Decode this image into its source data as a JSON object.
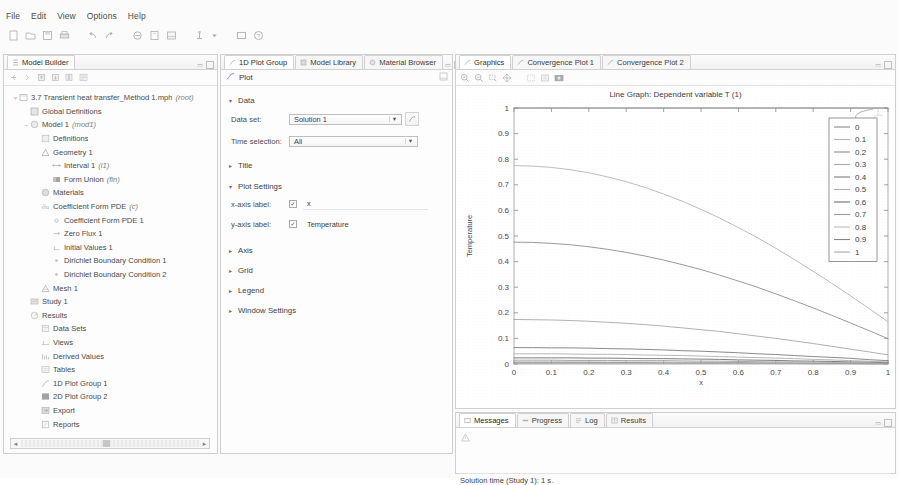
{
  "menubar": {
    "items": [
      "File",
      "Edit",
      "View",
      "Options",
      "Help"
    ]
  },
  "toolbar": {
    "icons": [
      "new-icon",
      "open-icon",
      "save-icon",
      "print-icon",
      "undo-icon",
      "redo-icon",
      "copy-icon",
      "paste-icon",
      "delete-icon",
      "build-icon",
      "dropdown-arrow-icon",
      "window-icon",
      "help-icon"
    ]
  },
  "model_builder": {
    "tab_label": "Model Builder",
    "toolbar_icons": [
      "collapse-icon",
      "expand-icon",
      "move-up-icon",
      "move-down-icon",
      "group-icon",
      "settings-icon"
    ],
    "tree": [
      {
        "depth": 0,
        "expander": "▿",
        "icon": "mph-file-icon",
        "label": "3.7 Transient heat transfer_Method 1.mph",
        "note": "(root)"
      },
      {
        "depth": 1,
        "expander": "",
        "icon": "global-definitions-icon",
        "label": "Global Definitions",
        "note": ""
      },
      {
        "depth": 1,
        "expander": "–",
        "icon": "model-icon",
        "label": "Model 1",
        "note": "(mod1)"
      },
      {
        "depth": 2,
        "expander": "",
        "icon": "definitions-icon",
        "label": "Definitions",
        "note": ""
      },
      {
        "depth": 2,
        "expander": "",
        "icon": "geometry-icon",
        "label": "Geometry 1",
        "note": ""
      },
      {
        "depth": 3,
        "expander": "",
        "icon": "interval-icon",
        "label": "Interval 1",
        "note": "(i1)"
      },
      {
        "depth": 3,
        "expander": "",
        "icon": "form-union-icon",
        "label": "Form Union",
        "note": "(fin)"
      },
      {
        "depth": 2,
        "expander": "",
        "icon": "materials-icon",
        "label": "Materials",
        "note": ""
      },
      {
        "depth": 2,
        "expander": "",
        "icon": "pde-icon",
        "label": "Coefficient Form PDE",
        "note": "(c)"
      },
      {
        "depth": 3,
        "expander": "",
        "icon": "node-icon",
        "label": "Coefficient Form PDE 1",
        "note": ""
      },
      {
        "depth": 3,
        "expander": "",
        "icon": "zero-flux-icon",
        "label": "Zero Flux 1",
        "note": ""
      },
      {
        "depth": 3,
        "expander": "",
        "icon": "initial-values-icon",
        "label": "Initial Values 1",
        "note": ""
      },
      {
        "depth": 3,
        "expander": "",
        "icon": "dirichlet-icon",
        "label": "Dirichlet Boundary Condition 1",
        "note": ""
      },
      {
        "depth": 3,
        "expander": "",
        "icon": "dirichlet-icon",
        "label": "Dirichlet Boundary Condition 2",
        "note": ""
      },
      {
        "depth": 2,
        "expander": "",
        "icon": "mesh-icon",
        "label": "Mesh 1",
        "note": ""
      },
      {
        "depth": 1,
        "expander": "",
        "icon": "study-icon",
        "label": "Study 1",
        "note": ""
      },
      {
        "depth": 1,
        "expander": "",
        "icon": "results-icon",
        "label": "Results",
        "note": ""
      },
      {
        "depth": 2,
        "expander": "",
        "icon": "data-sets-icon",
        "label": "Data Sets",
        "note": ""
      },
      {
        "depth": 2,
        "expander": "",
        "icon": "views-icon",
        "label": "Views",
        "note": ""
      },
      {
        "depth": 2,
        "expander": "",
        "icon": "derived-values-icon",
        "label": "Derived Values",
        "note": ""
      },
      {
        "depth": 2,
        "expander": "",
        "icon": "tables-icon",
        "label": "Tables",
        "note": ""
      },
      {
        "depth": 2,
        "expander": "",
        "icon": "plot-1d-icon",
        "label": "1D Plot Group 1",
        "note": ""
      },
      {
        "depth": 2,
        "expander": "",
        "icon": "plot-2d-icon",
        "label": "2D Plot Group 2",
        "note": ""
      },
      {
        "depth": 2,
        "expander": "",
        "icon": "export-icon",
        "label": "Export",
        "note": ""
      },
      {
        "depth": 2,
        "expander": "",
        "icon": "reports-icon",
        "label": "Reports",
        "note": ""
      }
    ]
  },
  "settings": {
    "tabs": [
      {
        "label": "1D Plot Group",
        "icon": "plot-1d-icon",
        "active": true
      },
      {
        "label": "Model Library",
        "icon": "library-icon",
        "active": false
      },
      {
        "label": "Material Browser",
        "icon": "material-icon",
        "active": false
      }
    ],
    "header_label": "Plot",
    "sections": {
      "data": {
        "title": "Data",
        "expanded": true,
        "arrow": "▾"
      },
      "title": {
        "title": "Title",
        "expanded": false,
        "arrow": "▸"
      },
      "plot_settings": {
        "title": "Plot Settings",
        "expanded": true,
        "arrow": "▾"
      },
      "axis": {
        "title": "Axis",
        "expanded": false,
        "arrow": "▸"
      },
      "grid": {
        "title": "Grid",
        "expanded": false,
        "arrow": "▸"
      },
      "legend": {
        "title": "Legend",
        "expanded": false,
        "arrow": "▸"
      },
      "window_settings": {
        "title": "Window Settings",
        "expanded": false,
        "arrow": "▸"
      }
    },
    "fields": {
      "data_set_label": "Data set:",
      "data_set_value": "Solution 1",
      "time_selection_label": "Time selection:",
      "time_selection_value": "All",
      "x_axis_label_label": "x-axis label:",
      "x_axis_label_value": "x",
      "x_axis_label_checked": true,
      "y_axis_label_label": "y-axis label:",
      "y_axis_label_value": "Temperature",
      "y_axis_label_checked": true,
      "checkmark": "✓"
    }
  },
  "graphics": {
    "tabs": [
      {
        "label": "Graphics",
        "icon": "graphics-icon",
        "active": true
      },
      {
        "label": "Convergence Plot 1",
        "icon": "graphics-icon",
        "active": false
      },
      {
        "label": "Convergence Plot 2",
        "icon": "graphics-icon",
        "active": false
      }
    ],
    "toolbar_icons": [
      "zoom-in-icon",
      "zoom-out-icon",
      "zoom-box-icon",
      "zoom-extents-icon",
      "select-icon",
      "transparency-icon",
      "image-snapshot-icon"
    ],
    "axis_orientation_icon": "axis-orientation-icon"
  },
  "messages": {
    "tabs": [
      {
        "label": "Messages",
        "icon": "messages-icon",
        "active": true
      },
      {
        "label": "Progress",
        "icon": "progress-icon",
        "active": false
      },
      {
        "label": "Log",
        "icon": "log-icon",
        "active": false
      },
      {
        "label": "Results",
        "icon": "results-table-icon",
        "active": false
      }
    ],
    "warning_icon": "warning-icon",
    "status_text": "Solution time (Study 1): 1 s."
  },
  "chart_data": {
    "type": "line",
    "title": "Line Graph: Dependent variable T (1)",
    "xlabel": "x",
    "ylabel": "Temperature",
    "xlim": [
      0,
      1
    ],
    "ylim": [
      0,
      1
    ],
    "xticks": [
      0,
      0.1,
      0.2,
      0.3,
      0.4,
      0.5,
      0.6,
      0.7,
      0.8,
      0.9,
      1
    ],
    "yticks": [
      0,
      0.1,
      0.2,
      0.3,
      0.4,
      0.5,
      0.6,
      0.7,
      0.8,
      0.9,
      1
    ],
    "grid": false,
    "legend_position": "upper right",
    "legend_title": "",
    "x": [
      0,
      0.05,
      0.1,
      0.15,
      0.2,
      0.25,
      0.3,
      0.35,
      0.4,
      0.45,
      0.5,
      0.55,
      0.6,
      0.65,
      0.7,
      0.75,
      0.8,
      0.85,
      0.9,
      0.95,
      1
    ],
    "series": [
      {
        "name": "0",
        "color": "#8a8a8a",
        "values": [
          1,
          1,
          1,
          1,
          1,
          1,
          1,
          1,
          1,
          1,
          1,
          1,
          1,
          1,
          1,
          1,
          1,
          1,
          1,
          1,
          1
        ]
      },
      {
        "name": "0.1",
        "color": "#b4b4b4",
        "values": [
          0.775,
          0.773,
          0.768,
          0.759,
          0.747,
          0.731,
          0.712,
          0.69,
          0.664,
          0.636,
          0.604,
          0.57,
          0.533,
          0.494,
          0.452,
          0.408,
          0.362,
          0.315,
          0.266,
          0.216,
          0.165
        ]
      },
      {
        "name": "0.2",
        "color": "#8f8f8f",
        "values": [
          0.476,
          0.475,
          0.471,
          0.466,
          0.458,
          0.448,
          0.436,
          0.422,
          0.406,
          0.388,
          0.369,
          0.347,
          0.324,
          0.3,
          0.274,
          0.247,
          0.219,
          0.19,
          0.16,
          0.13,
          0.099
        ]
      },
      {
        "name": "0.3",
        "color": "#a8a8a8",
        "values": [
          0.174,
          0.173,
          0.172,
          0.17,
          0.167,
          0.163,
          0.159,
          0.154,
          0.148,
          0.141,
          0.134,
          0.127,
          0.118,
          0.109,
          0.1,
          0.09,
          0.08,
          0.069,
          0.058,
          0.047,
          0.036
        ]
      },
      {
        "name": "0.4",
        "color": "#7e7e7e",
        "values": [
          0.064,
          0.064,
          0.063,
          0.063,
          0.062,
          0.06,
          0.059,
          0.057,
          0.055,
          0.052,
          0.05,
          0.047,
          0.044,
          0.04,
          0.037,
          0.033,
          0.029,
          0.026,
          0.022,
          0.017,
          0.013
        ]
      },
      {
        "name": "0.5",
        "color": "#b0b0b0",
        "values": [
          0.04,
          0.04,
          0.04,
          0.039,
          0.038,
          0.038,
          0.037,
          0.035,
          0.034,
          0.033,
          0.031,
          0.029,
          0.027,
          0.025,
          0.023,
          0.021,
          0.018,
          0.016,
          0.013,
          0.011,
          0.008
        ]
      },
      {
        "name": "0.6",
        "color": "#6f6f6f",
        "values": [
          0.024,
          0.024,
          0.024,
          0.024,
          0.023,
          0.023,
          0.022,
          0.021,
          0.021,
          0.02,
          0.019,
          0.018,
          0.016,
          0.015,
          0.014,
          0.012,
          0.011,
          0.01,
          0.008,
          0.007,
          0.005
        ]
      },
      {
        "name": "0.7",
        "color": "#9c9c9c",
        "values": [
          0.015,
          0.015,
          0.015,
          0.014,
          0.014,
          0.014,
          0.013,
          0.013,
          0.013,
          0.012,
          0.011,
          0.011,
          0.01,
          0.009,
          0.008,
          0.008,
          0.007,
          0.006,
          0.005,
          0.004,
          0.003
        ]
      },
      {
        "name": "0.8",
        "color": "#bdbdbd",
        "values": [
          0.009,
          0.009,
          0.009,
          0.009,
          0.009,
          0.008,
          0.008,
          0.008,
          0.008,
          0.007,
          0.007,
          0.006,
          0.006,
          0.005,
          0.005,
          0.005,
          0.004,
          0.004,
          0.003,
          0.002,
          0.002
        ]
      },
      {
        "name": "0.9",
        "color": "#858585",
        "values": [
          0.005,
          0.005,
          0.005,
          0.005,
          0.005,
          0.005,
          0.005,
          0.005,
          0.004,
          0.004,
          0.004,
          0.004,
          0.004,
          0.003,
          0.003,
          0.003,
          0.002,
          0.002,
          0.002,
          0.001,
          0.001
        ]
      },
      {
        "name": "1",
        "color": "#aaaaaa",
        "values": [
          0.003,
          0.003,
          0.003,
          0.003,
          0.003,
          0.003,
          0.003,
          0.003,
          0.003,
          0.002,
          0.002,
          0.002,
          0.002,
          0.002,
          0.002,
          0.002,
          0.001,
          0.001,
          0.001,
          0.001,
          0.0
        ]
      }
    ]
  }
}
